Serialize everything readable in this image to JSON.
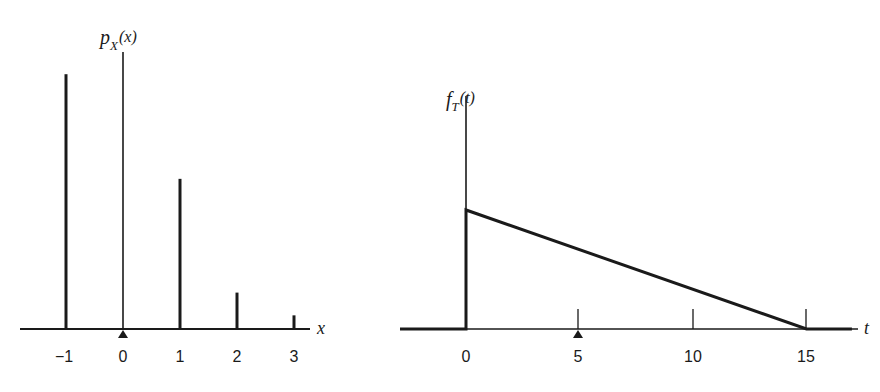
{
  "colors": {
    "ink": "#1a1a1a",
    "background": "#ffffff"
  },
  "left": {
    "ylabel": {
      "main": "p",
      "sub": "X",
      "arg": "(x)"
    },
    "xlabel": "x",
    "tick_labels": [
      "−1",
      "0",
      "1",
      "2",
      "3"
    ],
    "mean_marker": "▲"
  },
  "right": {
    "ylabel": {
      "main": "f",
      "sub": "T",
      "arg": "(t)"
    },
    "xlabel": "t",
    "tick_labels": [
      "0",
      "5",
      "10",
      "15"
    ],
    "mean_marker": "▲"
  },
  "chart_data": [
    {
      "type": "bar",
      "subtype": "stem (probability mass function)",
      "title": "",
      "xlabel": "x",
      "ylabel": "p_X(x)",
      "categories": [
        -1,
        0,
        1,
        2,
        3
      ],
      "values": [
        0.56,
        0,
        0.33,
        0.08,
        0.03
      ],
      "xlim": [
        -1.8,
        3.3
      ],
      "ylim": [
        0,
        0.62
      ],
      "grid": false,
      "legend": null,
      "annotations": [
        {
          "type": "triangle-marker",
          "x": 0,
          "meaning": "mean"
        }
      ],
      "y_ticks_labeled": false
    },
    {
      "type": "line",
      "subtype": "probability density function (triangular)",
      "title": "",
      "xlabel": "t",
      "ylabel": "f_T(t)",
      "x": [
        -3,
        0,
        0,
        15,
        17
      ],
      "y": [
        0,
        0,
        0.1333,
        0,
        0
      ],
      "xticks": [
        0,
        5,
        10,
        15
      ],
      "xlim": [
        -3,
        17
      ],
      "ylim": [
        0,
        0.26
      ],
      "grid": false,
      "legend": null,
      "annotations": [
        {
          "type": "triangle-marker",
          "x": 5,
          "meaning": "mean"
        }
      ],
      "y_ticks_labeled": false
    }
  ]
}
